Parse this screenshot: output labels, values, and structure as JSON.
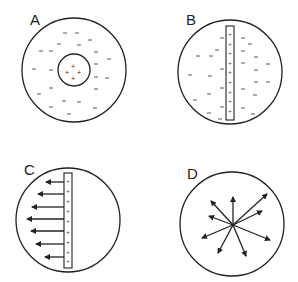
{
  "figure": {
    "stroke_color": "#222222",
    "background": "#ffffff",
    "panels": [
      {
        "id": "A",
        "label": "A",
        "description": "Sphere with central positive charge cluster surrounded by negative charges",
        "inner_charges": [
          "+",
          "+",
          "+",
          "+"
        ],
        "outer_charge_symbol": "–"
      },
      {
        "id": "B",
        "label": "B",
        "description": "Sphere with vertical positive-charged rod and negative charges on both sides",
        "rod_charges": [
          "+",
          "+",
          "+",
          "+",
          "+",
          "+",
          "+",
          "+",
          "+",
          "+",
          "+"
        ],
        "outer_charge_symbol": "–"
      },
      {
        "id": "C",
        "label": "C",
        "description": "Sphere with vertical positive-charged rod and leftward arrows",
        "rod_charges": [
          "+",
          "+",
          "+",
          "+",
          "+",
          "+",
          "+",
          "+",
          "+"
        ],
        "arrow_count": 7,
        "arrow_direction": "left"
      },
      {
        "id": "D",
        "label": "D",
        "description": "Sphere with arrows radiating outward from a central point",
        "arrow_count": 8,
        "arrow_direction": "radial"
      }
    ]
  }
}
